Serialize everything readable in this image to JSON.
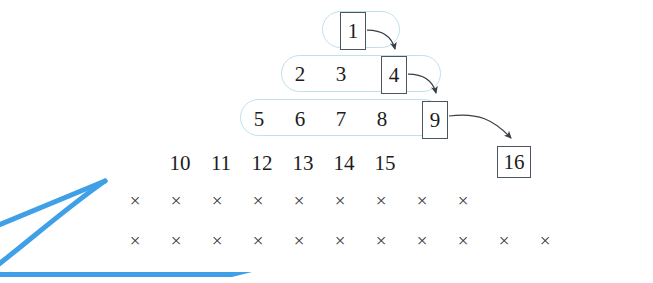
{
  "figure": {
    "colors": {
      "capsule_stroke": "#bfe0ec",
      "box_stroke": "#4a5560",
      "number_text": "#1c1c20",
      "x_mark": "#3a3a40",
      "brand_blue": "#3fa0e8",
      "background": "#ffffff"
    },
    "rows": [
      {
        "id": "row-1",
        "capsule": true,
        "numbers": [
          {
            "value": "1",
            "boxed": true,
            "x": 340,
            "y": 22
          }
        ]
      },
      {
        "id": "row-2",
        "capsule": true,
        "numbers": [
          {
            "value": "2",
            "boxed": false,
            "x": 299,
            "y": 65
          },
          {
            "value": "3",
            "boxed": false,
            "x": 340,
            "y": 65
          },
          {
            "value": "4",
            "boxed": true,
            "x": 381,
            "y": 65
          }
        ]
      },
      {
        "id": "row-3",
        "capsule": true,
        "numbers": [
          {
            "value": "5",
            "boxed": false,
            "x": 258,
            "y": 110
          },
          {
            "value": "6",
            "boxed": false,
            "x": 299,
            "y": 110
          },
          {
            "value": "7",
            "boxed": false,
            "x": 340,
            "y": 110
          },
          {
            "value": "8",
            "boxed": false,
            "x": 381,
            "y": 110
          },
          {
            "value": "9",
            "boxed": true,
            "x": 422,
            "y": 110
          }
        ]
      },
      {
        "id": "row-4",
        "capsule": false,
        "numbers": [
          {
            "value": "10",
            "boxed": false,
            "x": 176,
            "y": 155
          },
          {
            "value": "11",
            "boxed": false,
            "x": 217,
            "y": 155
          },
          {
            "value": "12",
            "boxed": false,
            "x": 258,
            "y": 155
          },
          {
            "value": "13",
            "boxed": false,
            "x": 299,
            "y": 155
          },
          {
            "value": "14",
            "boxed": false,
            "x": 340,
            "y": 155
          },
          {
            "value": "15",
            "boxed": false,
            "x": 381,
            "y": 155
          },
          {
            "value": "16",
            "boxed": true,
            "x": 422,
            "y": 155
          }
        ]
      },
      {
        "id": "row-5",
        "capsule": false,
        "x_count": 9,
        "x_start": 135,
        "x_step": 41,
        "y": 200
      },
      {
        "id": "row-6",
        "capsule": false,
        "x_count": 11,
        "x_start": 135,
        "x_step": 41,
        "y": 240
      }
    ],
    "x_mark_glyph": "×",
    "arrows": [
      {
        "from": "1",
        "to": "4",
        "label": "arrow-1-to-4"
      },
      {
        "from": "4",
        "to": "9",
        "label": "arrow-4-to-9"
      },
      {
        "from": "9",
        "to": "16",
        "label": "arrow-9-to-16"
      }
    ],
    "brand_mark": {
      "name": "blue-wedge-watermark",
      "visible": true
    }
  }
}
